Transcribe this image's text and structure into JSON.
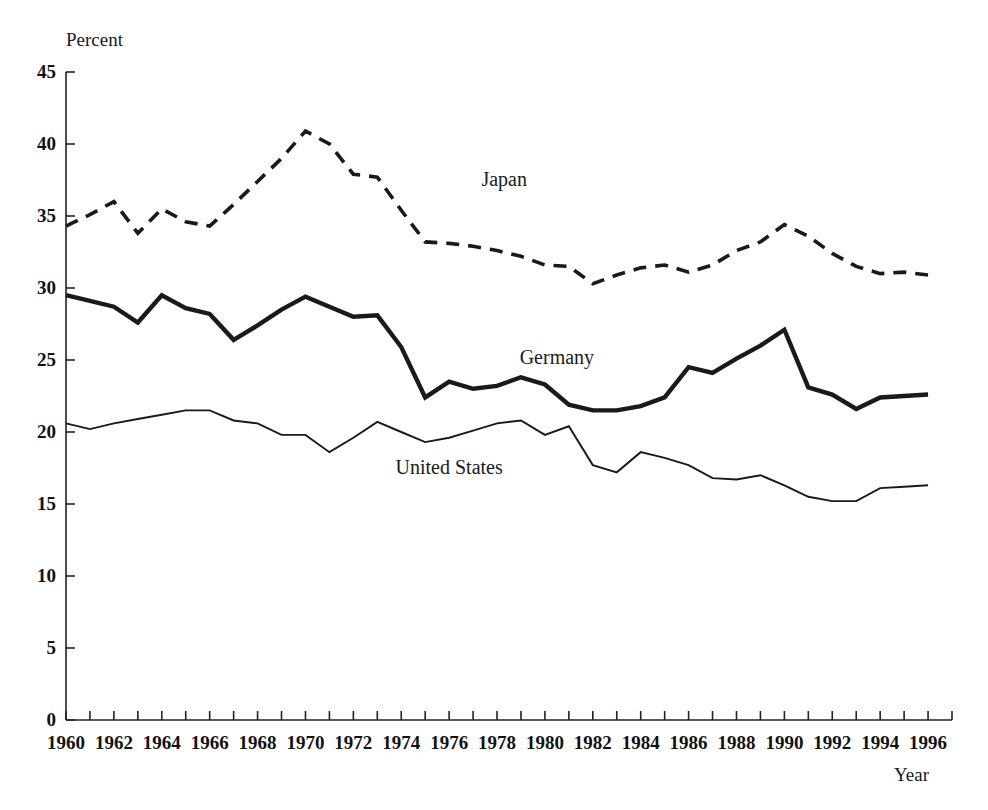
{
  "chart_data": {
    "type": "line",
    "title": "",
    "xlabel": "Year",
    "ylabel": "Percent",
    "xlim": [
      1960,
      1997
    ],
    "ylim": [
      0,
      45
    ],
    "grid": false,
    "legend_position": "inline-annotations",
    "x": [
      1960,
      1961,
      1962,
      1963,
      1964,
      1965,
      1966,
      1967,
      1968,
      1969,
      1970,
      1971,
      1972,
      1973,
      1974,
      1975,
      1976,
      1977,
      1978,
      1979,
      1980,
      1981,
      1982,
      1983,
      1984,
      1985,
      1986,
      1987,
      1988,
      1989,
      1990,
      1991,
      1992,
      1993,
      1994,
      1995,
      1996
    ],
    "xticks": [
      1960,
      1962,
      1964,
      1966,
      1968,
      1970,
      1972,
      1974,
      1976,
      1978,
      1980,
      1982,
      1984,
      1986,
      1988,
      1990,
      1992,
      1994,
      1996
    ],
    "xtick_labels": [
      "1960",
      "1962",
      "1964",
      "1966",
      "1968",
      "1970",
      "1972",
      "1974",
      "1976",
      "1978",
      "1980",
      "1982",
      "1984",
      "1986",
      "1988",
      "1990",
      "1992",
      "1994",
      "1996"
    ],
    "xtick_minor_every": 1,
    "yticks": [
      0,
      5,
      10,
      15,
      20,
      25,
      30,
      35,
      40,
      45
    ],
    "ytick_labels": [
      "0",
      "5",
      "10",
      "15",
      "20",
      "25",
      "30",
      "35",
      "40",
      "45"
    ],
    "series": [
      {
        "name": "Japan",
        "style": "dashed",
        "color": "#1a1a1a",
        "width": 3.6,
        "label_x": 1978.3,
        "label_y": 37.6,
        "values": [
          34.3,
          35.1,
          36.0,
          33.8,
          35.5,
          34.6,
          34.3,
          35.8,
          37.4,
          39.0,
          40.9,
          40.0,
          37.9,
          37.7,
          35.4,
          33.2,
          33.1,
          32.9,
          32.6,
          32.2,
          31.6,
          31.5,
          30.3,
          30.9,
          31.4,
          31.6,
          31.1,
          31.6,
          32.6,
          33.2,
          34.4,
          33.6,
          32.4,
          31.5,
          31.0,
          31.1,
          30.9
        ]
      },
      {
        "name": "Germany",
        "style": "solid-thick",
        "color": "#1a1a1a",
        "width": 4.4,
        "label_x": 1980.5,
        "label_y": 25.2,
        "values": [
          29.5,
          29.1,
          28.7,
          27.6,
          29.5,
          28.6,
          28.2,
          26.4,
          27.4,
          28.5,
          29.4,
          28.7,
          28.0,
          28.1,
          25.9,
          22.4,
          23.5,
          23.0,
          23.2,
          23.8,
          23.3,
          21.9,
          21.5,
          21.5,
          21.8,
          22.4,
          24.5,
          24.1,
          25.1,
          26.0,
          27.1,
          23.1,
          22.6,
          21.6,
          22.4,
          22.5,
          22.6
        ]
      },
      {
        "name": "United States",
        "style": "solid-thin",
        "color": "#1a1a1a",
        "width": 1.9,
        "label_x": 1976.0,
        "label_y": 17.6,
        "values": [
          20.6,
          20.2,
          20.6,
          20.9,
          21.2,
          21.5,
          21.5,
          20.8,
          20.6,
          19.8,
          19.8,
          18.6,
          19.6,
          20.7,
          20.0,
          19.3,
          19.6,
          20.1,
          20.6,
          20.8,
          19.8,
          20.4,
          17.7,
          17.2,
          18.6,
          18.2,
          17.7,
          16.8,
          16.7,
          17.0,
          16.3,
          15.5,
          15.2,
          15.2,
          16.1,
          16.2,
          16.3
        ]
      }
    ]
  },
  "plot": {
    "left_px": 66,
    "right_px": 952,
    "top_px": 72,
    "bottom_px": 720,
    "tick_len_px": 9,
    "axis_color": "#222222",
    "axis_width": 1.6
  }
}
